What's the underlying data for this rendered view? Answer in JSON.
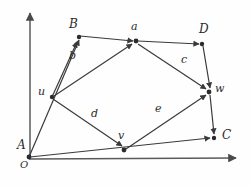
{
  "figure": {
    "stroke_color": "#3a3a3a",
    "label_color": "#2b2b2b",
    "background": "#fefefe"
  },
  "axes": {
    "origin": {
      "x": 29,
      "y": 157
    },
    "y_axis": {
      "from_x": 30,
      "from_y": 157,
      "to_x": 30,
      "to_y": 12,
      "label": ""
    },
    "x_axis": {
      "from_x": 29,
      "from_y": 159,
      "to_x": 238,
      "to_y": 158,
      "label": ""
    },
    "origin_label": "O"
  },
  "vertices": [
    {
      "id": "A",
      "label": "A",
      "x": 29,
      "y": 157,
      "label_x": 17,
      "label_y": 140,
      "kind": "corner"
    },
    {
      "id": "B",
      "label": "B",
      "x": 78,
      "y": 37,
      "label_x": 69,
      "label_y": 19,
      "kind": "corner"
    },
    {
      "id": "C",
      "label": "C",
      "x": 214,
      "y": 138,
      "label_x": 222,
      "label_y": 130,
      "kind": "corner"
    },
    {
      "id": "D",
      "label": "D",
      "x": 202,
      "y": 43,
      "label_x": 199,
      "label_y": 24,
      "kind": "corner"
    },
    {
      "id": "u",
      "label": "u",
      "x": 52,
      "y": 97,
      "label_x": 38,
      "label_y": 87,
      "kind": "node"
    },
    {
      "id": "v",
      "label": "v",
      "x": 124,
      "y": 150,
      "label_x": 118,
      "label_y": 131,
      "kind": "node"
    },
    {
      "id": "w",
      "label": "w",
      "x": 209,
      "y": 92,
      "label_x": 215,
      "label_y": 84,
      "kind": "node"
    },
    {
      "id": "a",
      "label": "a",
      "x": 136,
      "y": 41,
      "label_x": 131,
      "label_y": 22,
      "kind": "node"
    }
  ],
  "edges": [
    {
      "id": "A-B",
      "from": "A",
      "to": "B",
      "label": "",
      "arrow": true
    },
    {
      "id": "B-a",
      "from": "B",
      "to": "a",
      "label": "",
      "arrow": true
    },
    {
      "id": "a-D",
      "from": "a",
      "to": "D",
      "label": "",
      "arrow": true
    },
    {
      "id": "D-w",
      "from": "D",
      "to": "w",
      "label": "",
      "arrow": true
    },
    {
      "id": "w-C",
      "from": "w",
      "to": "C",
      "label": "",
      "arrow": true
    },
    {
      "id": "A-C",
      "from": "A",
      "to": "C",
      "label": "",
      "arrow": true
    },
    {
      "id": "u-B",
      "from": "u",
      "to": "B",
      "label": "",
      "arrow": true
    },
    {
      "id": "A-u",
      "from": "A",
      "to": "u",
      "label": "",
      "arrow": false
    },
    {
      "id": "u-a",
      "from": "u",
      "to": "a",
      "label": "b",
      "arrow": true,
      "label_x": 69,
      "label_y": 50
    },
    {
      "id": "a-w",
      "from": "a",
      "to": "w",
      "label": "c",
      "arrow": true,
      "label_x": 181,
      "label_y": 54
    },
    {
      "id": "u-v",
      "from": "u",
      "to": "v",
      "label": "d",
      "arrow": true,
      "label_x": 91,
      "label_y": 108
    },
    {
      "id": "v-w",
      "from": "v",
      "to": "w",
      "label": "e",
      "arrow": true,
      "label_x": 155,
      "label_y": 103
    }
  ],
  "edge_labels": [
    {
      "id": "b",
      "text": "b"
    },
    {
      "id": "c",
      "text": "c"
    },
    {
      "id": "d",
      "text": "d"
    },
    {
      "id": "e",
      "text": "e"
    }
  ]
}
